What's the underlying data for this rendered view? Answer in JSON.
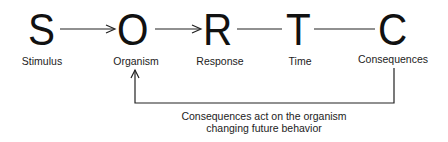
{
  "diagram": {
    "nodes": [
      {
        "letter": "S",
        "label": "Stimulus"
      },
      {
        "letter": "O",
        "label": "Organism"
      },
      {
        "letter": "R",
        "label": "Response"
      },
      {
        "letter": "T",
        "label": "Time"
      },
      {
        "letter": "C",
        "label": "Consequences"
      }
    ],
    "edges": [
      {
        "from": "S",
        "to": "O",
        "style": "arrow"
      },
      {
        "from": "O",
        "to": "R",
        "style": "arrow"
      },
      {
        "from": "R",
        "to": "T",
        "style": "line"
      },
      {
        "from": "T",
        "to": "C",
        "style": "line"
      },
      {
        "from": "C",
        "to": "O",
        "style": "feedback-arrow"
      }
    ],
    "feedback_caption_line1": "Consequences act on the organism",
    "feedback_caption_line2": "changing future behavior"
  }
}
